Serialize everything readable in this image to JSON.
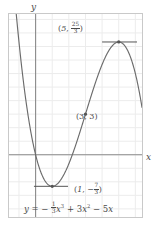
{
  "figure": {
    "background": "#ffffff",
    "border_color": "#c9c9c9",
    "grid_color": "#ececec",
    "axis_color": "#8a8a8a",
    "curve_color": "#6b6b6b",
    "point_color": "#555555",
    "text_color": "#4a4a4a"
  },
  "axes": {
    "x_label": "x",
    "y_label": "y",
    "x_axis_y_value": 0,
    "y_axis_x_value": 0,
    "xlim": [
      -1.6,
      6.4
    ],
    "ylim": [
      -4.6,
      10.4
    ],
    "grid": true,
    "grid_step": 1,
    "tick_labels_shown": false
  },
  "labels": {
    "max_point": {
      "text": "(5, 25/3)",
      "x_part": "5",
      "frac_num": "25",
      "frac_den": "3",
      "open": "(",
      "comma": ", ",
      "close": ")"
    },
    "inflection_point": {
      "text": "(3, 3)"
    },
    "min_point": {
      "x_part": "1",
      "sign": "−",
      "frac_num": "7",
      "frac_den": "3",
      "open": "(",
      "comma": ", ",
      "close": ")"
    },
    "equation": {
      "lhs": "y",
      "eq": " = ",
      "minus": "− ",
      "coef1_num": "1",
      "coef1_den": "3",
      "term1_var": "x",
      "term1_exp": "3",
      "plus": " + ",
      "coef2": "3",
      "term2_var": "x",
      "term2_exp": "2",
      "minus2": " − ",
      "coef3": "5",
      "term3_var": "x"
    }
  },
  "chart_data": {
    "type": "line",
    "title": "",
    "xlabel": "x",
    "ylabel": "y",
    "xlim": [
      -1.6,
      6.4
    ],
    "ylim": [
      -4.6,
      10.4
    ],
    "grid": true,
    "legend": null,
    "function": "y = -1/3*x^3 + 3*x^2 - 5*x",
    "coefficients": {
      "x3": -0.3333333333,
      "x2": 3,
      "x1": -5,
      "x0": 0
    },
    "series": [
      {
        "name": "y = -1/3 x^3 + 3 x^2 - 5 x",
        "x": [
          -1.6,
          -1.4,
          -1.2,
          -1.0,
          -0.8,
          -0.6,
          -0.4,
          -0.2,
          0.0,
          0.2,
          0.4,
          0.6,
          0.8,
          1.0,
          1.2,
          1.4,
          1.6,
          1.8,
          2.0,
          2.2,
          2.4,
          2.6,
          2.8,
          3.0,
          3.2,
          3.4,
          3.6,
          3.8,
          4.0,
          4.2,
          4.4,
          4.6,
          4.8,
          5.0,
          5.2,
          5.4,
          5.6,
          5.8,
          6.0,
          6.2,
          6.4
        ],
        "y": [
          17.05,
          14.06,
          11.38,
          9.0,
          6.91,
          5.11,
          3.58,
          2.13,
          0.0,
          -0.88,
          -1.54,
          -1.99,
          -2.25,
          -2.33,
          -2.26,
          -2.04,
          -1.71,
          -1.27,
          -0.67,
          0.03,
          0.78,
          1.58,
          2.45,
          3.0,
          3.88,
          4.75,
          5.62,
          6.43,
          7.33,
          8.03,
          8.68,
          9.23,
          9.67,
          8.33,
          9.87,
          9.61,
          9.2,
          8.61,
          7.2,
          6.44,
          4.93
        ]
      }
    ],
    "marked_points": [
      {
        "label": "(1, -7/3)",
        "x": 1,
        "y": -2.333333,
        "kind": "local-minimum",
        "tangent": "horizontal"
      },
      {
        "label": "(3, 3)",
        "x": 3,
        "y": 3,
        "kind": "inflection",
        "tangent": "none"
      },
      {
        "label": "(5, 25/3)",
        "x": 5,
        "y": 8.333333,
        "kind": "local-maximum",
        "tangent": "horizontal"
      }
    ],
    "tangent_segments": [
      {
        "at_point": "(5, 25/3)",
        "x_from": 4.0,
        "x_to": 6.1,
        "y": 8.333333
      },
      {
        "at_point": "(1, -7/3)",
        "x_from": -0.1,
        "x_to": 1.95,
        "y": -2.333333
      }
    ]
  }
}
